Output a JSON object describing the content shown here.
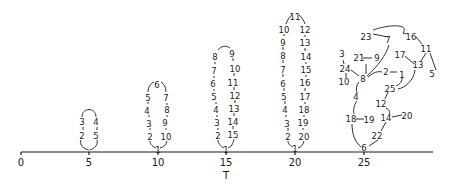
{
  "figure": {
    "axis": {
      "label": "T",
      "ticks": [
        {
          "value": "0",
          "x": 21
        },
        {
          "value": "5",
          "x": 89
        },
        {
          "value": "10",
          "x": 158
        },
        {
          "value": "15",
          "x": 226
        },
        {
          "value": "20",
          "x": 295
        },
        {
          "value": "25",
          "x": 364
        }
      ],
      "x_start": 21,
      "x_end": 433,
      "y": 152
    },
    "loops": [
      {
        "name": "loop-t5",
        "nodes": [
          {
            "label": "2",
            "x": 82,
            "y": 136
          },
          {
            "label": "3",
            "x": 82,
            "y": 122
          },
          {
            "label": "4",
            "x": 96,
            "y": 122
          },
          {
            "label": "5",
            "x": 96,
            "y": 136
          }
        ],
        "path": "M89,150 C80,148 80,142 81,140 M83,127 L83,130 M82,117 C82,107 96,107 96,117 M97,127 L97,130 M97,140 C98,145 95,148 90,150"
      },
      {
        "name": "loop-t10",
        "nodes": [
          {
            "label": "1",
            "x": 158,
            "y": 150
          },
          {
            "label": "2",
            "x": 150,
            "y": 137
          },
          {
            "label": "3",
            "x": 149,
            "y": 124
          },
          {
            "label": "4",
            "x": 147,
            "y": 111
          },
          {
            "label": "5",
            "x": 148,
            "y": 98
          },
          {
            "label": "6",
            "x": 157,
            "y": 85
          },
          {
            "label": "7",
            "x": 166,
            "y": 98
          },
          {
            "label": "8",
            "x": 167,
            "y": 110
          },
          {
            "label": "9",
            "x": 165,
            "y": 123
          },
          {
            "label": "10",
            "x": 166,
            "y": 137
          }
        ],
        "path": "M156,148 C151,146 150,143 150,141 M150,130 L150,128 M149,117 L149,115 M148,104 L148,102 M148,92 C148,87 151,83 154,82 M161,82 C164,84 166,87 166,92 M167,103 L167,105 M167,115 L167,117 M166,128 L166,130 M167,141 C166,145 164,147 160,148"
      },
      {
        "name": "loop-t15",
        "nodes": [
          {
            "label": "1",
            "x": 226,
            "y": 150
          },
          {
            "label": "2",
            "x": 218,
            "y": 136
          },
          {
            "label": "3",
            "x": 217,
            "y": 123
          },
          {
            "label": "4",
            "x": 216,
            "y": 110
          },
          {
            "label": "5",
            "x": 214,
            "y": 97
          },
          {
            "label": "6",
            "x": 213,
            "y": 84
          },
          {
            "label": "7",
            "x": 214,
            "y": 71
          },
          {
            "label": "8",
            "x": 215,
            "y": 57
          },
          {
            "label": "9",
            "x": 232,
            "y": 54
          },
          {
            "label": "10",
            "x": 235,
            "y": 69
          },
          {
            "label": "11",
            "x": 233,
            "y": 83
          },
          {
            "label": "12",
            "x": 235,
            "y": 96
          },
          {
            "label": "13",
            "x": 234,
            "y": 109
          },
          {
            "label": "14",
            "x": 233,
            "y": 122
          },
          {
            "label": "15",
            "x": 233,
            "y": 135
          }
        ],
        "path": "M224,148 C220,146 218,143 218,140 M218,130 L218,128 M217,117 L217,115 M216,104 L216,102 M214,91 L214,89 M214,78 L214,76 M215,64 L215,62 M218,50 C221,46 226,45 230,48 M233,58 L233,61 M234,73 L234,76 M234,87 L234,90 M235,100 L235,103 M234,113 L234,116 M233,126 L233,129 M234,139 C233,144 231,147 228,148"
      },
      {
        "name": "loop-t20",
        "nodes": [
          {
            "label": "1",
            "x": 295,
            "y": 149
          },
          {
            "label": "2",
            "x": 288,
            "y": 137
          },
          {
            "label": "3",
            "x": 287,
            "y": 124
          },
          {
            "label": "4",
            "x": 285,
            "y": 110
          },
          {
            "label": "5",
            "x": 284,
            "y": 97
          },
          {
            "label": "6",
            "x": 283,
            "y": 84
          },
          {
            "label": "7",
            "x": 283,
            "y": 70
          },
          {
            "label": "8",
            "x": 283,
            "y": 56
          },
          {
            "label": "9",
            "x": 283,
            "y": 43
          },
          {
            "label": "10",
            "x": 284,
            "y": 30
          },
          {
            "label": "11",
            "x": 295,
            "y": 17
          },
          {
            "label": "12",
            "x": 305,
            "y": 30
          },
          {
            "label": "13",
            "x": 305,
            "y": 43
          },
          {
            "label": "14",
            "x": 306,
            "y": 57
          },
          {
            "label": "15",
            "x": 306,
            "y": 70
          },
          {
            "label": "16",
            "x": 305,
            "y": 83
          },
          {
            "label": "17",
            "x": 305,
            "y": 97
          },
          {
            "label": "18",
            "x": 304,
            "y": 110
          },
          {
            "label": "19",
            "x": 303,
            "y": 123
          },
          {
            "label": "20",
            "x": 304,
            "y": 137
          }
        ],
        "path": "M293,147 C289,145 288,143 288,141 M288,131 L288,128 M286,117 L286,115 M285,104 L285,101 M284,91 L284,88 M283,77 L283,74 M283,63 L283,60 M283,50 L283,47 M284,36 L284,34 M286,24 C288,19 290,16 292,15 M299,15 C301,17 304,20 305,24 M305,35 L305,37 M305,48 L305,51 M306,62 L306,64 M306,75 L306,77 M305,88 L305,91 M305,102 L305,104 M304,115 L304,117 M303,128 L303,130 M304,141 C303,145 301,147 298,148"
      }
    ],
    "cluster_t25": {
      "nodes": [
        {
          "label": "23",
          "x": 366,
          "y": 37
        },
        {
          "label": "7",
          "x": 388,
          "y": 40
        },
        {
          "label": "16",
          "x": 411,
          "y": 37
        },
        {
          "label": "11",
          "x": 426,
          "y": 49
        },
        {
          "label": "3",
          "x": 342,
          "y": 54
        },
        {
          "label": "21",
          "x": 359,
          "y": 58
        },
        {
          "label": "9",
          "x": 377,
          "y": 58
        },
        {
          "label": "17",
          "x": 400,
          "y": 55
        },
        {
          "label": "13",
          "x": 418,
          "y": 65
        },
        {
          "label": "24",
          "x": 345,
          "y": 69
        },
        {
          "label": "8",
          "x": 363,
          "y": 79
        },
        {
          "label": "2",
          "x": 386,
          "y": 72
        },
        {
          "label": "1",
          "x": 402,
          "y": 75
        },
        {
          "label": "5",
          "x": 432,
          "y": 74
        },
        {
          "label": "10",
          "x": 344,
          "y": 82
        },
        {
          "label": "25",
          "x": 390,
          "y": 89
        },
        {
          "label": "4",
          "x": 356,
          "y": 97
        },
        {
          "label": "12",
          "x": 381,
          "y": 104
        },
        {
          "label": "18",
          "x": 351,
          "y": 119
        },
        {
          "label": "19",
          "x": 369,
          "y": 120
        },
        {
          "label": "14",
          "x": 386,
          "y": 118
        },
        {
          "label": "20",
          "x": 407,
          "y": 116
        },
        {
          "label": "22",
          "x": 377,
          "y": 136
        },
        {
          "label": "6",
          "x": 364,
          "y": 148
        }
      ],
      "path": "M373,34 L388,37 M373,30 C390,24 410,24 403,33 M406,34 L403,33 M416,37 L422,44 M430,53 L436,70 M426,53 L421,61 M414,64 L405,56 M343,60 L344,64 M363,58 L372,58 M346,73 L346,78 M351,70 L359,76 M366,64 L366,74 M367,76 C378,66 386,55 389,45 M368,77 C374,72 378,71 382,72 M390,72 L397,72 M402,78 C402,83 398,85 396,86 M415,70 C414,80 405,88 398,89 M359,82 C356,85 356,90 357,93 M357,101 C354,105 353,110 354,114 M356,119 L364,119 M388,92 L385,99 M386,108 C390,110 390,113 389,114 M402,115 L392,117 M386,122 L381,131 M378,140 L369,146 M361,147 C355,142 352,134 352,124"
    },
    "colors": {
      "ink": "#1a1a1a",
      "background": "#ffffff"
    }
  }
}
